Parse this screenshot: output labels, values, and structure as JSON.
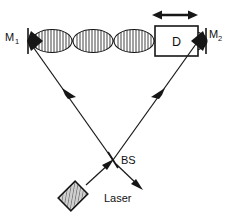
{
  "figure": {
    "domain_kind": "diagram",
    "canvas": {
      "width": 226,
      "height": 220,
      "background": "#ffffff"
    },
    "ink_color": "#161616",
    "laser_fill": "#cfcfcf"
  },
  "labels": {
    "mirror_left": {
      "base": "M",
      "sub": "1"
    },
    "mirror_right": {
      "base": "M",
      "sub": "2"
    },
    "element_box": "D",
    "beam_splitter": "BS",
    "source": "Laser"
  },
  "components": {
    "mirror_left_name": "M1",
    "mirror_right_name": "M2",
    "element_name": "D",
    "beamsplitter_name": "BS",
    "source_name": "Laser",
    "translation_arrow": "double-headed horizontal arrow above D",
    "mode_lobe_count_left_of_D": 3,
    "mode_lobe_count_right_of_D": 1
  },
  "geometry": {
    "cavity_axis_y": 41,
    "mirror_left_x": 31,
    "mirror_right_x": 196,
    "beamsplitter_x": 113,
    "beamsplitter_y": 160,
    "laser_center_x": 73,
    "laser_center_y": 196
  }
}
